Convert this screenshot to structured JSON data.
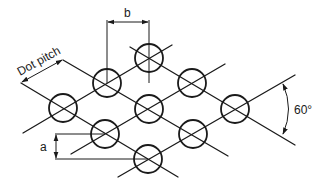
{
  "diagram": {
    "labels": {
      "dot_pitch": "Dot pitch",
      "b": "b",
      "a": "a",
      "angle": "60°"
    },
    "dots": [
      {
        "id": "top",
        "cx": 149,
        "cy": 58
      },
      {
        "id": "r2-left",
        "cx": 107,
        "cy": 83
      },
      {
        "id": "r2-right",
        "cx": 192,
        "cy": 83
      },
      {
        "id": "r3-left",
        "cx": 63,
        "cy": 108
      },
      {
        "id": "r3-mid",
        "cx": 149,
        "cy": 109
      },
      {
        "id": "r3-right",
        "cx": 235,
        "cy": 109
      },
      {
        "id": "r4-left",
        "cx": 105,
        "cy": 134
      },
      {
        "id": "r4-right",
        "cx": 193,
        "cy": 134
      },
      {
        "id": "bottom",
        "cx": 148,
        "cy": 159
      }
    ],
    "dot_radius": 14,
    "colors": {
      "stroke": "#1a1a1a",
      "background": "#ffffff"
    }
  }
}
